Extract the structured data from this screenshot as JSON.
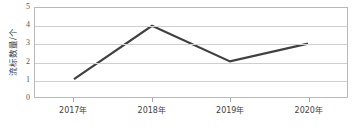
{
  "chart_data": {
    "type": "line",
    "title": "",
    "xlabel": "",
    "ylabel": "流标数量/个",
    "categories": [
      "2017年",
      "2018年",
      "2019年",
      "2020年"
    ],
    "values": [
      1,
      4,
      2,
      3
    ],
    "series": [
      {
        "name": "流标数量/个",
        "values": [
          1,
          4,
          2,
          3
        ]
      }
    ],
    "ylim": [
      0,
      5
    ],
    "ytick_labels": [
      "0",
      "1",
      "2",
      "3",
      "4",
      "5"
    ],
    "ytick_values": [
      0,
      1,
      2,
      3,
      4,
      5
    ],
    "grid": true,
    "legend": "none",
    "markers": false,
    "line_color": "#404040",
    "grid_color": "#cfcfcf",
    "frame_color": "#b9b9b9",
    "background": "#ffffff"
  }
}
